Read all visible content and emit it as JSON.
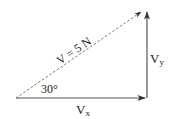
{
  "diagram": {
    "type": "vector-decomposition",
    "resultant": {
      "label": "V = 5 N",
      "magnitude": 5,
      "unit": "N",
      "style": "dashed"
    },
    "angle": {
      "label": "30°",
      "value_deg": 30
    },
    "x_component": {
      "label_main": "V",
      "label_sub": "x"
    },
    "y_component": {
      "label_main": "V",
      "label_sub": "y"
    },
    "colors": {
      "solid_line": "#555555",
      "dashed_line": "#777777",
      "text": "#222222",
      "background": "#ffffff"
    }
  }
}
